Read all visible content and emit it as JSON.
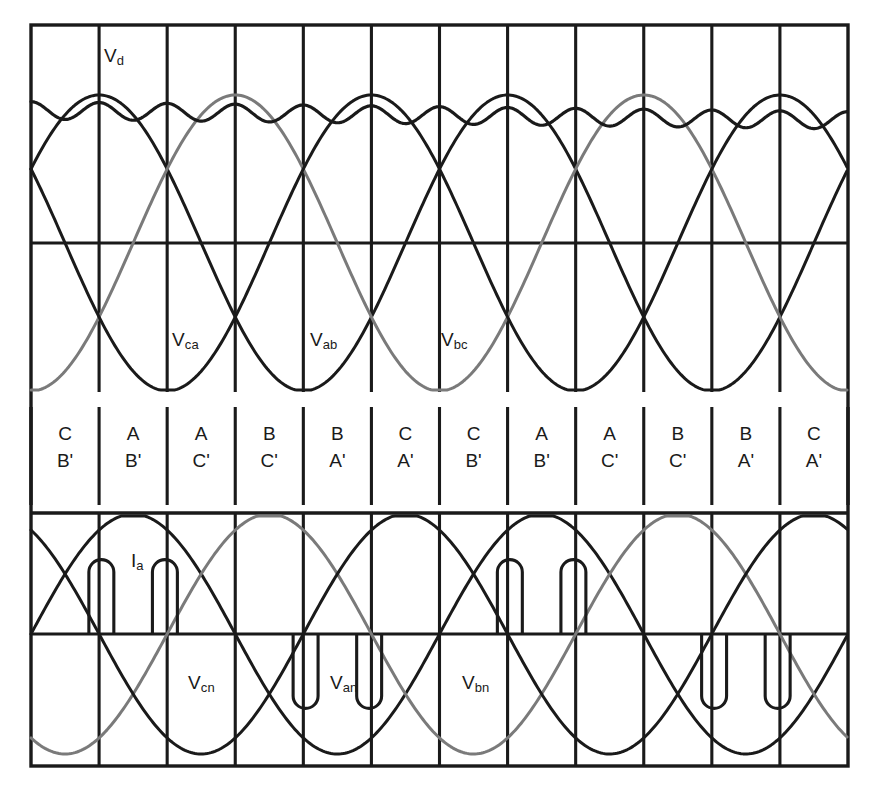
{
  "figure": {
    "frame": {
      "left": 31,
      "right": 848,
      "top": 25,
      "bottom": 766
    },
    "colors": {
      "frame": "#1a1a1a",
      "grid": "#1a1a1a",
      "phase_dark": "#1a1a1a",
      "phase_grey": "#7a7a7a",
      "dc_output": "#1a1a1a",
      "current": "#1a1a1a",
      "background": "#ffffff"
    },
    "columns": 12,
    "grid": {
      "vertical_count": 13,
      "upper_zero_y": 243,
      "lower_zero_y": 634,
      "band_top_y": 407,
      "band_bottom_y": 505,
      "upper_top_y": 25,
      "upper_bottom_y": 392,
      "lower_top_y": 513,
      "lower_bottom_y": 766
    }
  },
  "labels": {
    "dc_output": {
      "text": "V",
      "sub": "d",
      "x": 104,
      "y": 46
    },
    "line_voltages": [
      {
        "text": "V",
        "sub": "ca",
        "x": 172,
        "y": 330
      },
      {
        "text": "V",
        "sub": "ab",
        "x": 310,
        "y": 330
      },
      {
        "text": "V",
        "sub": "bc",
        "x": 441,
        "y": 330
      }
    ],
    "phase_current": {
      "text": "I",
      "sub": "a",
      "x": 131,
      "y": 551
    },
    "phase_voltages": [
      {
        "text": "V",
        "sub": "cn",
        "x": 188,
        "y": 673
      },
      {
        "text": "V",
        "sub": "an",
        "x": 330,
        "y": 673
      },
      {
        "text": "V",
        "sub": "bn",
        "x": 462,
        "y": 673
      }
    ]
  },
  "conduction_table": {
    "caption": "Conducting device pairs per 60-degree interval",
    "intervals": [
      {
        "upper": "C",
        "lower": "B'"
      },
      {
        "upper": "A",
        "lower": "B'"
      },
      {
        "upper": "A",
        "lower": "C'"
      },
      {
        "upper": "B",
        "lower": "C'"
      },
      {
        "upper": "B",
        "lower": "A'"
      },
      {
        "upper": "C",
        "lower": "A'"
      },
      {
        "upper": "C",
        "lower": "B'"
      },
      {
        "upper": "A",
        "lower": "B'"
      },
      {
        "upper": "A",
        "lower": "C'"
      },
      {
        "upper": "B",
        "lower": "C'"
      },
      {
        "upper": "B",
        "lower": "A'"
      },
      {
        "upper": "C",
        "lower": "A'"
      }
    ]
  },
  "chart_data": {
    "type": "line",
    "xlabel": "",
    "ylabel": "",
    "grid": true,
    "legend_position": "inline-annotations",
    "x_range_degrees": [
      0,
      720
    ],
    "upper_panel": {
      "name": "Line-to-line voltages and DC output",
      "ylim": [
        -1.1,
        1.1
      ],
      "series": [
        {
          "name": "Vab",
          "type": "sine",
          "amplitude": 1.0,
          "phase_degrees": 30,
          "color": "#1a1a1a",
          "period_degrees": 360
        },
        {
          "name": "Vbc",
          "type": "sine",
          "amplitude": 1.0,
          "phase_degrees": -90,
          "color": "#7a7a7a",
          "period_degrees": 360
        },
        {
          "name": "Vca",
          "type": "sine",
          "amplitude": 1.0,
          "phase_degrees": 150,
          "color": "#1a1a1a",
          "period_degrees": 360
        },
        {
          "name": "Vd",
          "type": "six-pulse-envelope-with-ripple",
          "mean_level": 0.955,
          "ripple_peak_to_peak": 0.14,
          "pulses_per_cycle": 6,
          "color": "#1a1a1a"
        }
      ]
    },
    "lower_panel": {
      "name": "Phase voltages and phase-a line current",
      "ylim": [
        -1.1,
        1.1
      ],
      "series": [
        {
          "name": "Van",
          "type": "sine",
          "amplitude": 1.0,
          "phase_degrees": 0,
          "color": "#1a1a1a",
          "period_degrees": 360
        },
        {
          "name": "Vbn",
          "type": "sine",
          "amplitude": 1.0,
          "phase_degrees": -120,
          "color": "#7a7a7a",
          "period_degrees": 360
        },
        {
          "name": "Vcn",
          "type": "sine",
          "amplitude": 1.0,
          "phase_degrees": 120,
          "color": "#1a1a1a",
          "period_degrees": 360
        },
        {
          "name": "Ia",
          "type": "discontinuous-current-pulses",
          "color": "#1a1a1a",
          "amplitude": 0.62,
          "pulses_per_cycle": 4,
          "pulse_width_degrees": 22,
          "pulse_centers_degrees": [
            62,
            118,
            242,
            298,
            422,
            478,
            602,
            658
          ],
          "pulse_polarity": [
            1,
            1,
            -1,
            -1,
            1,
            1,
            -1,
            -1
          ]
        }
      ]
    }
  }
}
